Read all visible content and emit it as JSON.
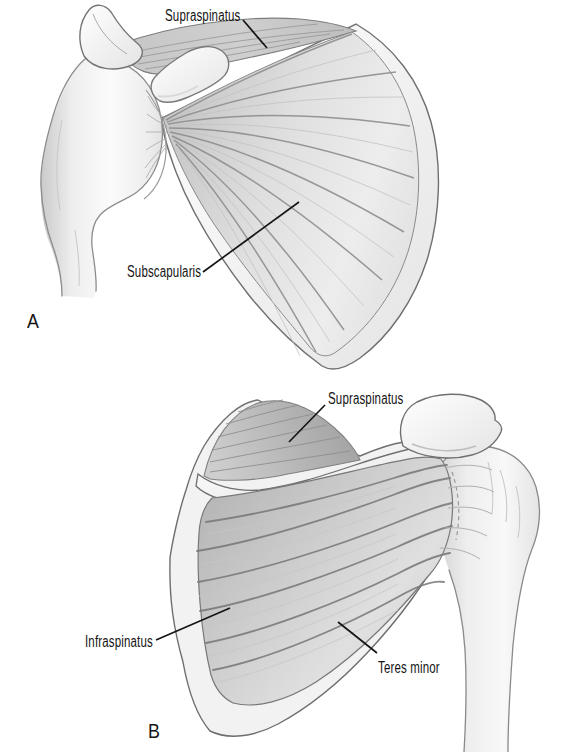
{
  "figure": {
    "background": "#ffffff",
    "ink_color": "#151515",
    "panels": {
      "a": {
        "letter": "A",
        "labels": {
          "supraspinatus": "Supraspinatus",
          "subscapularis": "Subscapularis"
        }
      },
      "b": {
        "letter": "B",
        "labels": {
          "supraspinatus": "Supraspinatus",
          "infraspinatus": "Infraspinatus",
          "teres_minor": "Teres minor"
        }
      }
    }
  }
}
